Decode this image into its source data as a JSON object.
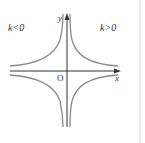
{
  "diagram": {
    "labels": {
      "left_region": "k<0",
      "right_region": "k>0",
      "origin": "O",
      "x_axis": "x",
      "y_axis": "y"
    },
    "colors": {
      "curve": "#8a8a8a",
      "axis": "#333333",
      "frame": "#d8d8d8"
    }
  }
}
